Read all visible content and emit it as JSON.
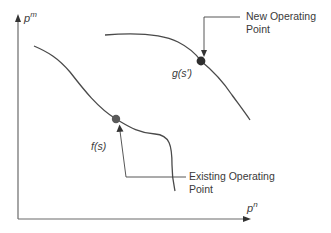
{
  "diagram": {
    "axes": {
      "y_label_base": "p",
      "y_label_sup": "m",
      "x_label_base": "p",
      "x_label_sup": "n"
    },
    "curves": [
      {
        "id": "f",
        "label": "f(s)"
      },
      {
        "id": "g",
        "label": "g(s')"
      }
    ],
    "annotations": {
      "new_point_line1": "New Operating",
      "new_point_line2": "Point",
      "existing_point_line1": "Existing Operating",
      "existing_point_line2": "Point"
    },
    "colors": {
      "line": "#4a4a4a",
      "dot": "#3f3f3f",
      "axis": "#6a6a6a",
      "text": "#3a3a3a"
    }
  }
}
